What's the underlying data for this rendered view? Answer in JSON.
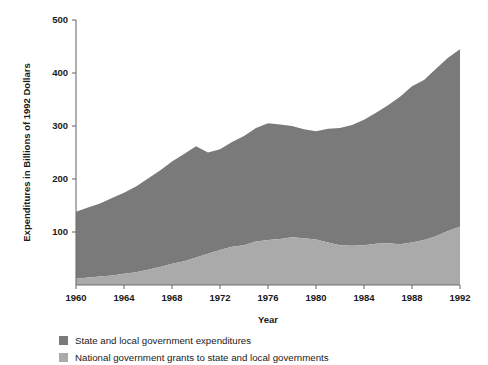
{
  "chart_data": {
    "type": "area",
    "title": "",
    "subtitle": "",
    "xlabel": "Year",
    "ylabel": "Expenditures in Billions of 1992 Dollars",
    "xlim": [
      1960,
      1992
    ],
    "ylim": [
      0,
      500
    ],
    "xticks": [
      1960,
      1964,
      1968,
      1972,
      1976,
      1980,
      1984,
      1988,
      1992
    ],
    "yticks": [
      0,
      100,
      200,
      300,
      400,
      500
    ],
    "xtick_labels": [
      "1960",
      "1964",
      "1968",
      "1972",
      "1976",
      "1980",
      "1984",
      "1988",
      "1992"
    ],
    "ytick_labels": [
      "100",
      "200",
      "300",
      "400",
      "500"
    ],
    "grid": false,
    "stacked": true,
    "legend_position": "below-left",
    "x": [
      1960,
      1961,
      1962,
      1963,
      1964,
      1965,
      1966,
      1967,
      1968,
      1969,
      1970,
      1971,
      1972,
      1973,
      1974,
      1975,
      1976,
      1977,
      1978,
      1979,
      1980,
      1981,
      1982,
      1983,
      1984,
      1985,
      1986,
      1987,
      1988,
      1989,
      1990,
      1991,
      1992
    ],
    "series": [
      {
        "name": "National government grants to state and local governments",
        "color": "#aaaaaa",
        "values": [
          12,
          14,
          16,
          18,
          21,
          24,
          29,
          34,
          40,
          45,
          52,
          59,
          66,
          72,
          75,
          82,
          85,
          87,
          90,
          88,
          86,
          80,
          75,
          74,
          75,
          78,
          79,
          77,
          80,
          85,
          92,
          102,
          110
        ]
      },
      {
        "name": "State and local government expenditures",
        "color": "#7a7a7a",
        "values": [
          126,
          132,
          138,
          146,
          153,
          162,
          172,
          182,
          193,
          202,
          210,
          191,
          190,
          198,
          206,
          214,
          220,
          216,
          210,
          206,
          204,
          215,
          221,
          228,
          237,
          247,
          260,
          278,
          295,
          302,
          316,
          327,
          335
        ]
      }
    ],
    "totals": [
      138,
      146,
      154,
      164,
      174,
      186,
      201,
      216,
      233,
      247,
      262,
      250,
      256,
      270,
      281,
      296,
      305,
      303,
      300,
      294,
      290,
      295,
      296,
      302,
      312,
      325,
      339,
      355,
      375,
      387,
      408,
      429,
      445
    ]
  },
  "legend": {
    "items": [
      {
        "label": "State and local government expenditures",
        "color": "#7a7a7a"
      },
      {
        "label": "National government grants to state and local governments",
        "color": "#aaaaaa"
      }
    ]
  }
}
